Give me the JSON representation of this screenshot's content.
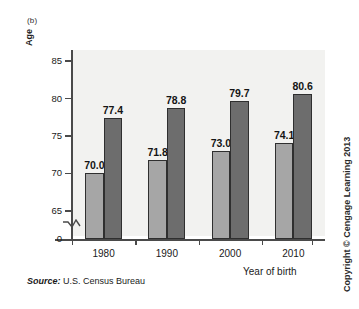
{
  "figure": {
    "panel_label": "(b)",
    "source_prefix": "Source:",
    "source_text": "U.S. Census Bureau",
    "copyright": "Copyright © Cengage Learning 2013"
  },
  "chart_data": {
    "type": "bar",
    "title": "",
    "xlabel": "Year of birth",
    "ylabel": "Age",
    "categories": [
      "1980",
      "1990",
      "2000",
      "2010"
    ],
    "series": [
      {
        "name": "light",
        "values": [
          70.0,
          71.8,
          73.0,
          74.1
        ],
        "color": "#a6a6a6",
        "labels": [
          "70.0",
          "71.8",
          "73.0",
          "74.1"
        ]
      },
      {
        "name": "dark",
        "values": [
          77.4,
          78.8,
          79.7,
          80.6
        ],
        "color": "#6d6d6d",
        "labels": [
          "77.4",
          "78.8",
          "79.7",
          "80.6"
        ]
      }
    ],
    "ylim": [
      63.5,
      86.5
    ],
    "yticks": [
      85,
      80,
      75,
      70,
      65
    ],
    "ytick_labels": [
      "85",
      "80",
      "75",
      "70",
      "65"
    ],
    "zero_tick_label": "0",
    "axis_break": true,
    "grid": false,
    "legend": "none"
  }
}
